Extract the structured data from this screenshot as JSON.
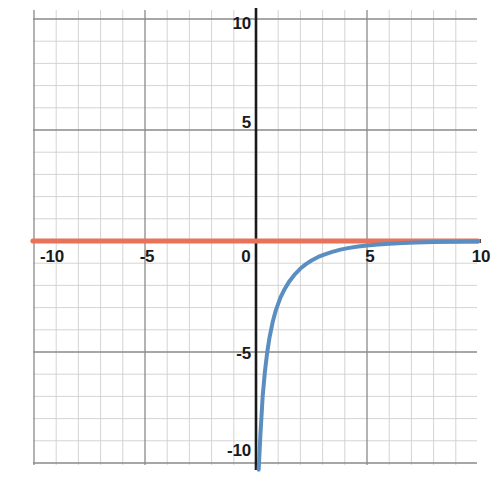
{
  "chart_data": {
    "type": "line",
    "title": "",
    "subtitle": "",
    "xlabel": "",
    "ylabel": "",
    "xlim": [
      -10.0,
      10.0
    ],
    "ylim": [
      -10.3,
      10.3
    ],
    "grid": true,
    "grid_minor_step": 1,
    "grid_major_step": 5,
    "legend_position": "none",
    "axis_style": {
      "x_axis": "solid black with black dashes overlay",
      "y_axis": "solid black"
    },
    "x_tick_labels": [
      "-10",
      "-5",
      "0",
      "5",
      "10"
    ],
    "x_tick_values": [
      -10,
      -5,
      0,
      5,
      10
    ],
    "y_tick_labels": [
      "10",
      "5",
      "-5",
      "-10"
    ],
    "y_tick_values": [
      10,
      5,
      -5,
      -10
    ],
    "series": [
      {
        "name": "exponential-curve",
        "color": "#5B8EC0",
        "style": "solid",
        "width": 4,
        "description": "decaying exponential approaching y=0 from below",
        "x": [
          0.12,
          0.2,
          0.3,
          0.4,
          0.5,
          0.6,
          0.75,
          0.9,
          1.1,
          1.3,
          1.5,
          1.75,
          2.0,
          2.25,
          2.5,
          2.8,
          3.1,
          3.4,
          3.8,
          4.2,
          4.6,
          5.0,
          5.5,
          6.0,
          6.6,
          7.2,
          8.0,
          8.8,
          9.6,
          10.0
        ],
        "y": [
          -10.3,
          -8.7,
          -7.0,
          -5.9,
          -5.05,
          -4.4,
          -3.65,
          -3.1,
          -2.55,
          -2.15,
          -1.82,
          -1.5,
          -1.24,
          -1.04,
          -0.88,
          -0.72,
          -0.6,
          -0.5,
          -0.39,
          -0.31,
          -0.25,
          -0.2,
          -0.155,
          -0.12,
          -0.09,
          -0.068,
          -0.046,
          -0.032,
          -0.022,
          -0.018
        ]
      },
      {
        "name": "horizontal-asymptote",
        "color": "#E8735A",
        "style": "solid",
        "width": 5,
        "description": "horizontal asymptote y = 0",
        "x": [
          -10.05,
          10.0
        ],
        "y": [
          0,
          0
        ]
      }
    ],
    "annotations": []
  },
  "plot": {
    "origin_px": {
      "x": 256,
      "y": 241
    },
    "px_per_unit": 22.2,
    "colors": {
      "curve": "#5B8EC0",
      "asymptote": "#E8735A",
      "axis": "#1a1a1a",
      "grid_minor": "#cfcfcf",
      "grid_major": "#8a8a8a",
      "background": "#ffffff",
      "tick_text": "#1a1a1a"
    }
  }
}
